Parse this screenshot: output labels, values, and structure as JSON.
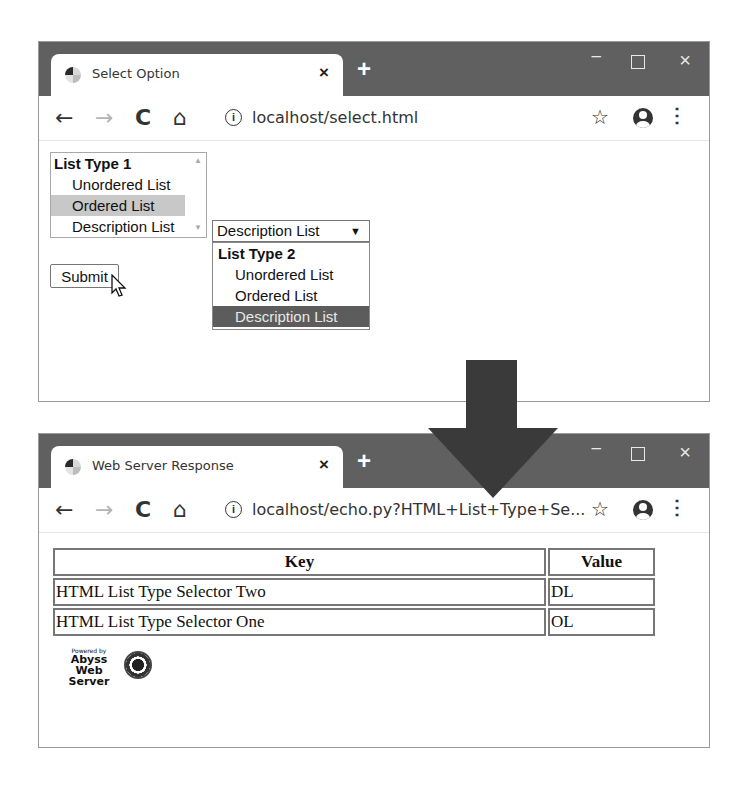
{
  "window1": {
    "tab_title": "Select Option",
    "tab_close": "×",
    "new_tab": "+",
    "url": "localhost/select.html",
    "page": {
      "listbox": {
        "group_label": "List Type 1",
        "options": [
          "Unordered List",
          "Ordered List",
          "Description List"
        ],
        "selected": "Ordered List"
      },
      "dropdown": {
        "current_value": "Description List",
        "arrow": "▼",
        "popup_group_label": "List Type 2",
        "popup_options": [
          "Unordered List",
          "Ordered List",
          "Description List"
        ],
        "highlighted": "Description List"
      },
      "submit_label": "Submit"
    }
  },
  "window2": {
    "tab_title": "Web Server Response",
    "tab_close": "×",
    "new_tab": "+",
    "url": "localhost/echo.py?HTML+List+Type+Se...",
    "page": {
      "table": {
        "headers": [
          "Key",
          "Value"
        ],
        "rows": [
          [
            "HTML List Type Selector Two",
            "DL"
          ],
          [
            "HTML List Type Selector One",
            "OL"
          ]
        ]
      },
      "badge": {
        "powered_by": "Powered by",
        "line1": "Abyss",
        "line2": "Web Server"
      }
    }
  },
  "chrome": {
    "back": "←",
    "forward": "→",
    "reload": "C",
    "home": "⌂",
    "info": "i",
    "star": "☆",
    "menu": "⋮",
    "minimize": "–",
    "close": "×"
  },
  "colors": {
    "titlebar": "#606060",
    "arrow": "#3a3a3a",
    "listbox_selected": "#c8c8c8",
    "dropdown_highlight": "#5c5c5c"
  }
}
